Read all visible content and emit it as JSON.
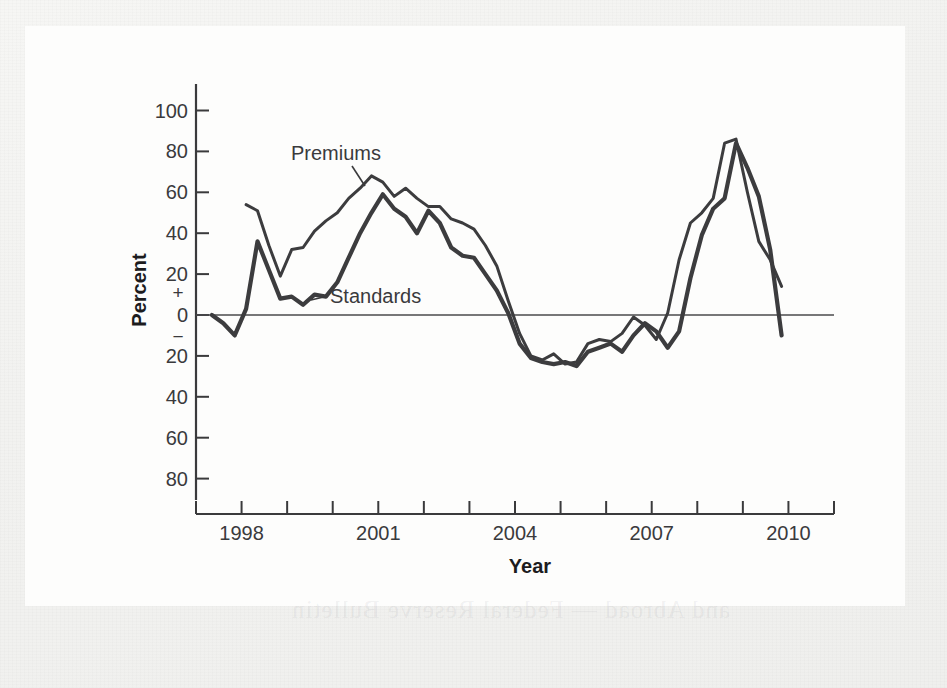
{
  "chart_data": {
    "type": "line",
    "title": "",
    "xlabel": "Year",
    "ylabel": "Percent",
    "xlim": [
      1997.0,
      2011.0
    ],
    "ylim": [
      -90,
      105
    ],
    "grid": false,
    "legend_position": "inline-annotations",
    "y_axis_style": "signed",
    "y_positive_sign": "+",
    "y_negative_sign": "−",
    "y_tick_labels": [
      "100",
      "80",
      "60",
      "40",
      "20",
      "0",
      "20",
      "40",
      "60",
      "80"
    ],
    "y_tick_values": [
      100,
      80,
      60,
      40,
      20,
      0,
      -20,
      -40,
      -60,
      -80
    ],
    "x_tick_labels": [
      "1998",
      "2001",
      "2004",
      "2007",
      "2010"
    ],
    "x_tick_values": [
      1998,
      2001,
      2004,
      2007,
      2010
    ],
    "x_minor_tick_values": [
      1997,
      1999,
      2000,
      2002,
      2003,
      2005,
      2006,
      2008,
      2009,
      2011
    ],
    "zero_line": 0,
    "series": [
      {
        "name": "Premiums",
        "color": "#3c3c3e",
        "annotation": "Premiums",
        "x": [
          1998.1,
          1998.35,
          1998.6,
          1998.85,
          1999.1,
          1999.35,
          1999.6,
          1999.85,
          2000.1,
          2000.35,
          2000.6,
          2000.85,
          2001.1,
          2001.35,
          2001.6,
          2001.85,
          2002.1,
          2002.35,
          2002.6,
          2002.85,
          2003.1,
          2003.35,
          2003.6,
          2003.85,
          2004.1,
          2004.35,
          2004.6,
          2004.85,
          2005.1,
          2005.35,
          2005.6,
          2005.85,
          2006.1,
          2006.35,
          2006.6,
          2006.85,
          2007.1,
          2007.35,
          2007.6,
          2007.85,
          2008.1,
          2008.35,
          2008.6,
          2008.85,
          2009.1,
          2009.35,
          2009.6,
          2009.85
        ],
        "values": [
          54,
          51,
          34,
          19,
          32,
          33,
          41,
          46,
          50,
          57,
          62,
          68,
          65,
          58,
          62,
          57,
          53,
          53,
          47,
          45,
          42,
          34,
          24,
          7,
          -9,
          -20,
          -22,
          -19,
          -24,
          -23,
          -14,
          -12,
          -13,
          -9,
          -1,
          -5,
          -12,
          1,
          27,
          45,
          50,
          57,
          84,
          86,
          60,
          36,
          27,
          14
        ]
      },
      {
        "name": "Standards",
        "color": "#3c3c3e",
        "annotation": "Standards",
        "x": [
          1997.35,
          1997.6,
          1997.85,
          1998.1,
          1998.35,
          1998.6,
          1998.85,
          1999.1,
          1999.35,
          1999.6,
          1999.85,
          2000.1,
          2000.35,
          2000.6,
          2000.85,
          2001.1,
          2001.35,
          2001.6,
          2001.85,
          2002.1,
          2002.35,
          2002.6,
          2002.85,
          2003.1,
          2003.35,
          2003.6,
          2003.85,
          2004.1,
          2004.35,
          2004.6,
          2004.85,
          2005.1,
          2005.35,
          2005.6,
          2005.85,
          2006.1,
          2006.35,
          2006.6,
          2006.85,
          2007.1,
          2007.35,
          2007.6,
          2007.85,
          2008.1,
          2008.35,
          2008.6,
          2008.85,
          2009.1,
          2009.35,
          2009.6,
          2009.85
        ],
        "values": [
          0,
          -4,
          -10,
          3,
          36,
          22,
          8,
          9,
          5,
          10,
          9,
          16,
          28,
          40,
          50,
          59,
          52,
          48,
          40,
          51,
          45,
          33,
          29,
          28,
          20,
          12,
          1,
          -14,
          -21,
          -23,
          -24,
          -23,
          -25,
          -18,
          -16,
          -14,
          -18,
          -10,
          -4,
          -8,
          -16,
          -8,
          18,
          39,
          52,
          57,
          84,
          72,
          58,
          32,
          -10
        ]
      }
    ]
  },
  "labels": {
    "y_axis_title": "Percent",
    "x_axis_title": "Year",
    "premiums": "Premiums",
    "standards": "Standards"
  },
  "bleed_through": {
    "ghost_text": "and Abroad — Federal Reserve Bulletin"
  }
}
